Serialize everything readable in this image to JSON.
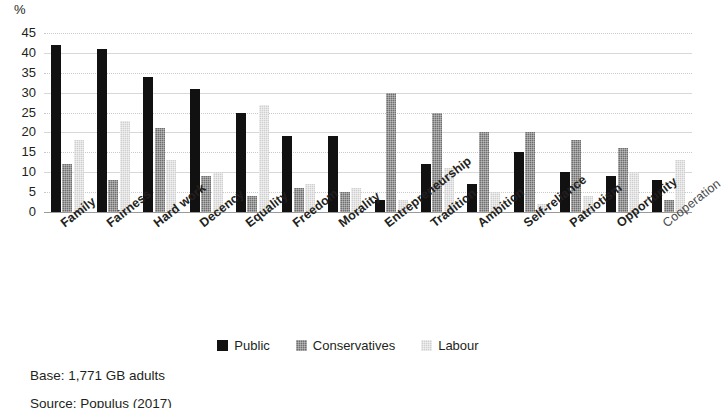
{
  "chart_data": {
    "type": "bar",
    "title": "",
    "xlabel": "",
    "ylabel": "%",
    "ylim": [
      0,
      45
    ],
    "yticks": [
      0,
      5,
      10,
      15,
      20,
      25,
      30,
      35,
      40,
      45
    ],
    "grid": true,
    "legend_position": "bottom-center",
    "categories": [
      "Family",
      "Fairness",
      "Hard work",
      "Decency",
      "Equality",
      "Freedom",
      "Morality",
      "Entrepreneurship",
      "Tradition",
      "Ambition",
      "Self-reliance",
      "Patriotism",
      "Opportunity",
      "Cooperation"
    ],
    "series": [
      {
        "name": "Public",
        "color": "#111111",
        "values": [
          42,
          41,
          34,
          31,
          25,
          19,
          19,
          3,
          12,
          7,
          15,
          10,
          9,
          8
        ]
      },
      {
        "name": "Conservatives",
        "color": "#6f6f6f",
        "values": [
          12,
          8,
          21,
          9,
          4,
          6,
          5,
          30,
          25,
          20,
          20,
          18,
          16,
          3
        ]
      },
      {
        "name": "Labour",
        "color": "#cfcfcf",
        "values": [
          18,
          23,
          13,
          10,
          27,
          7,
          6,
          3,
          11,
          5,
          2,
          4,
          10,
          13
        ]
      }
    ]
  },
  "axis": {
    "unit_label": "%"
  },
  "legend": {
    "items": [
      {
        "label": "Public",
        "key": "public"
      },
      {
        "label": "Conservatives",
        "key": "cons"
      },
      {
        "label": "Labour",
        "key": "labour"
      }
    ]
  },
  "footer": {
    "base_note": "Base: 1,771 GB adults",
    "source_note": "Source: Populus (2017)"
  }
}
